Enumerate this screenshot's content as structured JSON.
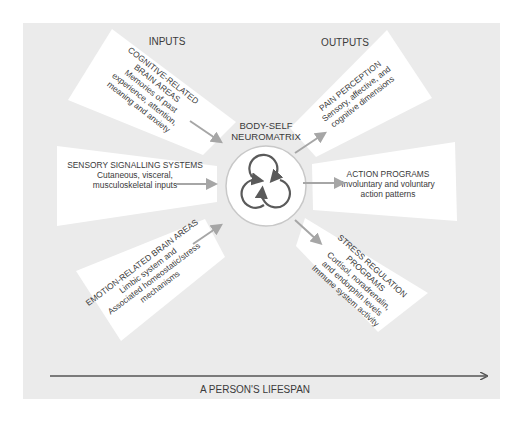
{
  "diagram": {
    "headers": {
      "inputs": "INPUTS",
      "outputs": "OUTPUTS"
    },
    "center": {
      "title_line1": "BODY-SELF",
      "title_line2": "NEUROMATRIX",
      "icon": "three-interlocking-circular-arrows-icon"
    },
    "inputs": [
      {
        "id": "cognitive",
        "lines": [
          "COGNITIVE-RELATED",
          "BRAIN AREAS",
          "Memories of past",
          "experience, attention,",
          "meaning and anxiety"
        ]
      },
      {
        "id": "sensory",
        "lines": [
          "SENSORY SIGNALLING SYSTEMS",
          "Cutaneous, visceral,",
          "musculoskeletal inputs"
        ]
      },
      {
        "id": "emotion",
        "lines": [
          "EMOTION-RELATED BRAIN AREAS",
          "Limbic system and",
          "Associated homeostatic/stress",
          "mechanisms"
        ]
      }
    ],
    "outputs": [
      {
        "id": "pain",
        "lines": [
          "PAIN PERCEPTION",
          "Sensory, affective, and",
          "cognitive dimensions"
        ]
      },
      {
        "id": "action",
        "lines": [
          "ACTION PROGRAMS",
          "Involuntary and voluntary",
          "action patterns"
        ]
      },
      {
        "id": "stress",
        "lines": [
          "STRESS REGULATION",
          "PROGRAMS",
          "Cortisol, noradrenalin,",
          "and endorphin levels",
          "Immune system activity"
        ]
      }
    ],
    "timeline": {
      "label": "A PERSON'S LIFESPAN"
    },
    "colors": {
      "background_panel": "#ebebeb",
      "boxes": "#ffffff",
      "arrows": "#a6a6a6",
      "timeline_arrow": "#555555",
      "text": "#3a3a3a",
      "circle_stroke": "#5a5a5a"
    }
  }
}
